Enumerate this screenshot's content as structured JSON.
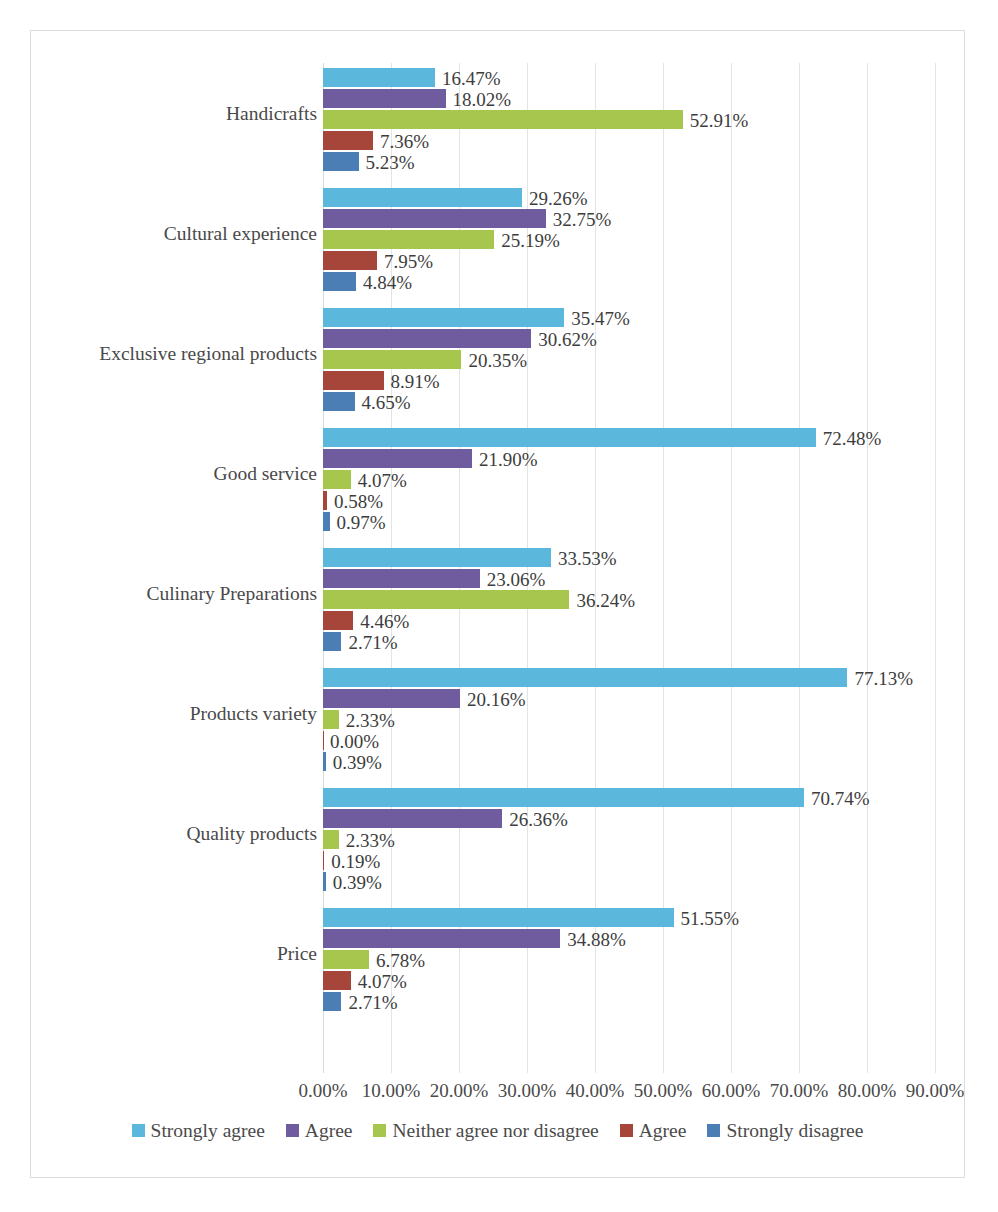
{
  "chart_data": {
    "type": "bar",
    "orientation": "horizontal",
    "grouped": true,
    "title": "",
    "subtitle": "",
    "xlabel": "",
    "ylabel": "",
    "xlim": [
      0,
      90
    ],
    "grid": true,
    "legend_position": "bottom",
    "value_label_format": "0.00%",
    "categories": [
      "Handicrafts",
      "Cultural experience",
      "Exclusive regional products",
      "Good service",
      "Culinary Preparations",
      "Products variety",
      "Quality products",
      "Price"
    ],
    "tick_labels": [
      "0.00%",
      "10.00%",
      "20.00%",
      "30.00%",
      "40.00%",
      "50.00%",
      "60.00%",
      "70.00%",
      "80.00%",
      "90.00%"
    ],
    "tick_values": [
      0,
      10,
      20,
      30,
      40,
      50,
      60,
      70,
      80,
      90
    ],
    "series": [
      {
        "name": "Strongly agree",
        "color": "#5CB7DD",
        "values": [
          16.47,
          29.26,
          35.47,
          72.48,
          33.53,
          77.13,
          70.74,
          51.55
        ],
        "labels": [
          "16.47%",
          "29.26%",
          "35.47%",
          "72.48%",
          "33.53%",
          "77.13%",
          "70.74%",
          "51.55%"
        ]
      },
      {
        "name": "Agree",
        "color": "#6E5C9E",
        "values": [
          18.02,
          32.75,
          30.62,
          21.9,
          23.06,
          20.16,
          26.36,
          34.88
        ],
        "labels": [
          "18.02%",
          "32.75%",
          "30.62%",
          "21.90%",
          "23.06%",
          "20.16%",
          "26.36%",
          "34.88%"
        ]
      },
      {
        "name": "Neither agree nor disagree",
        "color": "#A7C64E",
        "values": [
          52.91,
          25.19,
          20.35,
          4.07,
          36.24,
          2.33,
          2.33,
          6.78
        ],
        "labels": [
          "52.91%",
          "25.19%",
          "20.35%",
          "4.07%",
          "36.24%",
          "2.33%",
          "2.33%",
          "6.78%"
        ]
      },
      {
        "name": "Agree",
        "color": "#A6453A",
        "values": [
          7.36,
          7.95,
          8.91,
          0.58,
          4.46,
          0.0,
          0.19,
          4.07
        ],
        "labels": [
          "7.36%",
          "7.95%",
          "8.91%",
          "0.58%",
          "4.46%",
          "0.00%",
          "0.19%",
          "4.07%"
        ]
      },
      {
        "name": "Strongly disagree",
        "color": "#4A7EB5",
        "values": [
          5.23,
          4.84,
          4.65,
          0.97,
          2.71,
          0.39,
          0.39,
          2.71
        ],
        "labels": [
          "5.23%",
          "4.84%",
          "4.65%",
          "0.97%",
          "2.71%",
          "0.39%",
          "0.39%",
          "2.71%"
        ]
      }
    ]
  },
  "legend": {
    "items": [
      {
        "label": "Strongly agree",
        "color": "#5CB7DD"
      },
      {
        "label": "Agree",
        "color": "#6E5C9E"
      },
      {
        "label": "Neither agree nor disagree",
        "color": "#A7C64E"
      },
      {
        "label": "Agree",
        "color": "#A6453A"
      },
      {
        "label": "Strongly disagree",
        "color": "#4A7EB5"
      }
    ]
  }
}
